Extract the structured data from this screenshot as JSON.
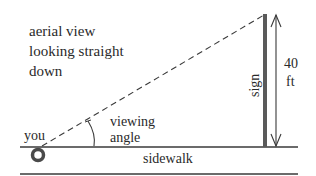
{
  "caption": {
    "lines": [
      "aerial view",
      "looking straight",
      "down"
    ]
  },
  "labels": {
    "you": "you",
    "viewing_angle_line1": "viewing",
    "viewing_angle_line2": "angle",
    "sign": "sign",
    "height_value": "40",
    "height_unit": "ft",
    "sidewalk": "sidewalk"
  },
  "measurements": {
    "sign_height": "40 ft"
  },
  "colors": {
    "line": "#3a3a3a",
    "sign_bar": "#5a5a5a",
    "text": "#2a2a2a",
    "background": "#ffffff"
  }
}
